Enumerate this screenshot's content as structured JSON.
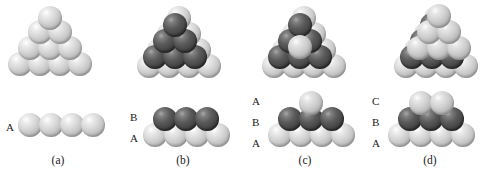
{
  "figure": {
    "background_color": "#ffffff",
    "colors": {
      "light_sphere": "#d6d6d6",
      "dark_sphere": "#4a4a4a",
      "label_text": "#1a1a1a"
    },
    "sphere_radius_px": 11,
    "panels": [
      {
        "id": "a",
        "caption": "(a)",
        "description": "single close-packed layer A",
        "layer_labels": [
          {
            "text": "A",
            "x": 6,
            "y": 122
          }
        ],
        "side_view_rows": [
          {
            "layer": "A",
            "shade": "light",
            "count": 4
          }
        ],
        "pyramid": {
          "description": "ten light spheres in a 4-3-2-1 triangular close-packed array",
          "rows": [
            {
              "shade": "light",
              "count": 1
            },
            {
              "shade": "light",
              "count": 2
            },
            {
              "shade": "light",
              "count": 3
            },
            {
              "shade": "light",
              "count": 4
            }
          ]
        }
      },
      {
        "id": "b",
        "caption": "(b)",
        "description": "second layer B nested in the hollows of layer A",
        "layer_labels": [
          {
            "text": "B",
            "x": 130,
            "y": 112
          },
          {
            "text": "A",
            "x": 130,
            "y": 133
          }
        ],
        "side_view_rows": [
          {
            "layer": "B",
            "shade": "dark",
            "count": 3
          },
          {
            "layer": "A",
            "shade": "light",
            "count": 4
          }
        ],
        "pyramid": {
          "description": "light 4-3-2-1 base array with six dark spheres 3-2-1 seated on top",
          "rows": [
            {
              "shade": "dark",
              "count": 1
            },
            {
              "shade": "dark",
              "count": 2
            },
            {
              "shade": "dark",
              "count": 3
            }
          ]
        }
      },
      {
        "id": "c",
        "caption": "(c)",
        "description": "third layer directly above layer A, giving the ABA hexagonal close-packed sequence",
        "layer_labels": [
          {
            "text": "A",
            "x": 252,
            "y": 96
          },
          {
            "text": "B",
            "x": 252,
            "y": 117
          },
          {
            "text": "A",
            "x": 252,
            "y": 138
          }
        ],
        "side_view_rows": [
          {
            "layer": "A",
            "shade": "light",
            "count": 1
          },
          {
            "layer": "B",
            "shade": "dark",
            "count": 3
          },
          {
            "layer": "A",
            "shade": "light",
            "count": 4
          }
        ],
        "pyramid": {
          "description": "light base array, dark B layer, and a light A sphere at the apex hollow",
          "rows": [
            {
              "shade": "dark",
              "count": 1
            },
            {
              "shade": "dark",
              "count": 2
            },
            {
              "shade": "dark",
              "count": 3
            },
            {
              "shade": "light",
              "count": 1
            }
          ]
        }
      },
      {
        "id": "d",
        "caption": "(d)",
        "description": "third layer offset into the remaining hollows, giving the ABC cubic close-packed sequence",
        "layer_labels": [
          {
            "text": "C",
            "x": 372,
            "y": 96
          },
          {
            "text": "B",
            "x": 372,
            "y": 117
          },
          {
            "text": "A",
            "x": 372,
            "y": 138
          }
        ],
        "side_view_rows": [
          {
            "layer": "C",
            "shade": "light",
            "count": 2
          },
          {
            "layer": "B",
            "shade": "dark",
            "count": 3
          },
          {
            "layer": "A",
            "shade": "light",
            "count": 4
          }
        ],
        "pyramid": {
          "description": "light base array, dark B layer, and a light C layer of three spheres on top",
          "rows": [
            {
              "shade": "light",
              "count": 1
            },
            {
              "shade": "light",
              "count": 2
            },
            {
              "shade": "dark",
              "count": 3
            },
            {
              "shade": "light",
              "count": 3
            }
          ]
        }
      }
    ]
  }
}
